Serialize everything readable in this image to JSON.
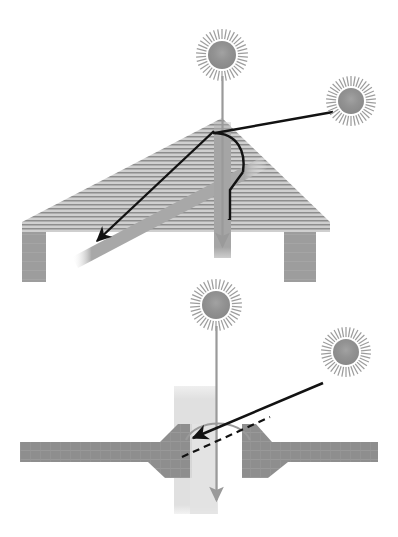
{
  "figure": {
    "width": 398,
    "height": 537,
    "background": "#ffffff"
  },
  "colors": {
    "background": "#ffffff",
    "hatch_fill": "#c9c9c9",
    "hatch_line": "#8f8f8f",
    "ground_fill": "#8e8e8e",
    "ground_line": "#9a9a9a",
    "pillar_fill": "#9d9d9d",
    "panel_bar": "#a6a6a6",
    "sun_disk": "#8c8c8c",
    "sun_ray": "#9a9a9a",
    "vertical_beam_top": "#a3a3a3",
    "vertical_beam_bottom": "#e0e0e0",
    "beam_arrow_line": "#9a9a9a",
    "black_line": "#111111",
    "dashed_line": "#111111"
  },
  "panels": [
    {
      "id": "roof-panel",
      "name": "pitched-roof-incidence-panel",
      "label": "Pitched roof solar incidence",
      "suns": [
        {
          "id": "roof-zenith-sun",
          "name": "zenith-sun",
          "cx": 222,
          "cy": 55,
          "disk_radius": 14,
          "ray_inner": 16,
          "ray_outer": 26,
          "ray_count": 38
        },
        {
          "id": "roof-oblique-sun",
          "name": "oblique-sun",
          "cx": 351,
          "cy": 101,
          "disk_radius": 13,
          "ray_inner": 15,
          "ray_outer": 25,
          "ray_count": 38
        }
      ],
      "vertical_beam": {
        "x": 222,
        "top": 122,
        "bottom": 258,
        "width": 16,
        "arrow_tip_y": 252
      },
      "oblique_ray": {
        "x1": 332,
        "y1": 112,
        "x2": 214,
        "y2": 133
      },
      "reflected_ray": {
        "x1": 214,
        "y1": 133,
        "x2": 94,
        "y2": 243
      },
      "angle_arc_label": "incidence angle arc",
      "surface_bar_label": "tilted surface bar",
      "normal_line_label": "surface normal"
    },
    {
      "id": "trench-panel",
      "name": "street-trench-incidence-panel",
      "label": "Street trench solar incidence",
      "suns": [
        {
          "id": "trench-zenith-sun",
          "name": "zenith-sun",
          "cx": 216,
          "cy": 305,
          "disk_radius": 14,
          "ray_inner": 16,
          "ray_outer": 26,
          "ray_count": 38
        },
        {
          "id": "trench-oblique-sun",
          "name": "oblique-sun",
          "cx": 346,
          "cy": 352,
          "disk_radius": 13,
          "ray_inner": 15,
          "ray_outer": 25,
          "ray_count": 38
        }
      ],
      "vertical_beam": {
        "x": 216,
        "top": 388,
        "bottom": 512,
        "width": 40,
        "arrow_tip_y": 506
      },
      "oblique_ray": {
        "x1": 323,
        "y1": 383,
        "x2": 190,
        "y2": 438
      },
      "dashed_reference": {
        "x1": 186,
        "y1": 455,
        "x2": 265,
        "y2": 418
      },
      "angle_arc_label": "incidence angle arc",
      "ground_label": "ground cross-section",
      "trench_label": "trench opening"
    }
  ],
  "legend_items": [
    {
      "name": "zenith-sun-icon",
      "label": "Sun at zenith"
    },
    {
      "name": "oblique-sun-icon",
      "label": "Sun at oblique angle"
    },
    {
      "name": "incidence-arrow",
      "label": "Incident solar ray"
    },
    {
      "name": "angle-arc",
      "label": "Angle of incidence"
    }
  ]
}
